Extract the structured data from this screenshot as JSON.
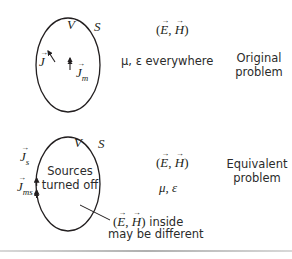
{
  "figure": {
    "top": {
      "region_label": "V",
      "surface_label": "S",
      "electric_current": "J",
      "magnetic_current": "J",
      "magnetic_current_sub": "m",
      "field_pair": "(E, H)",
      "field_E": "E",
      "field_H": "H",
      "medium_text": "μ, ε everywhere",
      "caption_line1": "Original",
      "caption_line2": "problem"
    },
    "bottom": {
      "region_label": "V",
      "surface_label": "S",
      "surface_electric_current": "J",
      "surface_electric_current_sub": "s",
      "surface_magnetic_current": "J",
      "surface_magnetic_current_sub": "ms",
      "inside_line1": "Sources",
      "inside_line2": "turned off",
      "field_E": "E",
      "field_H": "H",
      "medium_text": "μ, ε",
      "note_field_E": "E",
      "note_field_H": "H",
      "note_suffix": " inside",
      "note_line2": "may be different",
      "caption_line1": "Equivalent",
      "caption_line2": "problem"
    }
  }
}
